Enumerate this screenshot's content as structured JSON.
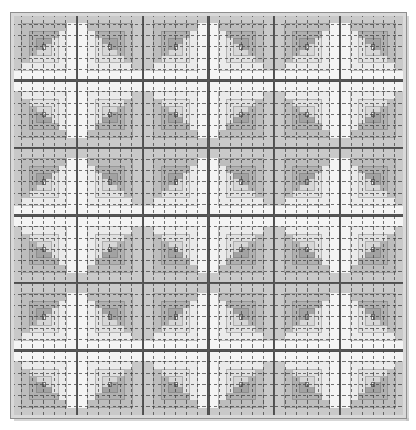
{
  "figure": {
    "canvas": {
      "width": 416,
      "height": 430,
      "background": "#ffffff"
    }
  },
  "chart_data": {
    "type": "heatmap",
    "subtitle": "6 x 6 grid of log cabin blocks with alternating light and dark halves",
    "xlabel": "",
    "ylabel": "",
    "grid": true,
    "legend_position": "none",
    "layout": {
      "grid_rows": 6,
      "grid_cols": 6,
      "quilt_left": 11,
      "quilt_top": 13,
      "quilt_width": 395,
      "quilt_height": 405,
      "block_width": 65.833,
      "block_height": 67.5,
      "rings_per_block": 4,
      "ring_widths": [
        10,
        8,
        7,
        6
      ],
      "center_size": 9
    },
    "frame": {
      "binding_outer": "#8e8e8e",
      "binding_inner": "#d9d9d9",
      "binding_width": 4,
      "shadow": "#b6b6b6"
    },
    "palette": {
      "light_1": "#f4f4f4",
      "light_2": "#eaeaea",
      "light_3": "#e0e0e0",
      "light_4": "#d6d6d6",
      "dark_1": "#c9c9c9",
      "dark_2": "#bdbdbd",
      "dark_3": "#b0b0b0",
      "dark_4": "#a2a2a2",
      "center_light": "#f7f7f7",
      "center_dark": "#9a9a9a",
      "sashing": "#c4c4c4",
      "ground": "#ededed"
    },
    "stitching": {
      "style": "dashed",
      "color": "#3a3a3a",
      "dash": "3.2 2.4",
      "stroke_width": 0.9,
      "spacing_x": 10.97,
      "spacing_y": 11.25
    },
    "categories": [
      "col-1",
      "col-2",
      "col-3",
      "col-4",
      "col-5",
      "col-6"
    ],
    "rows": [
      "row-1",
      "row-2",
      "row-3",
      "row-4",
      "row-5",
      "row-6"
    ],
    "orientations": [
      [
        "tl",
        "tr",
        "tl",
        "tr",
        "tl",
        "tr"
      ],
      [
        "bl",
        "br",
        "bl",
        "br",
        "bl",
        "br"
      ],
      [
        "tl",
        "tr",
        "tl",
        "tr",
        "tl",
        "tr"
      ],
      [
        "bl",
        "br",
        "bl",
        "br",
        "bl",
        "br"
      ],
      [
        "tl",
        "tr",
        "tl",
        "tr",
        "tl",
        "tr"
      ],
      [
        "bl",
        "br",
        "bl",
        "br",
        "bl",
        "br"
      ]
    ],
    "values": [
      [
        1,
        0,
        1,
        0,
        1,
        0
      ],
      [
        0,
        1,
        0,
        1,
        0,
        1
      ],
      [
        1,
        0,
        1,
        0,
        1,
        0
      ],
      [
        0,
        1,
        0,
        1,
        0,
        1
      ],
      [
        1,
        0,
        1,
        0,
        1,
        0
      ],
      [
        0,
        1,
        0,
        1,
        0,
        1
      ]
    ]
  }
}
